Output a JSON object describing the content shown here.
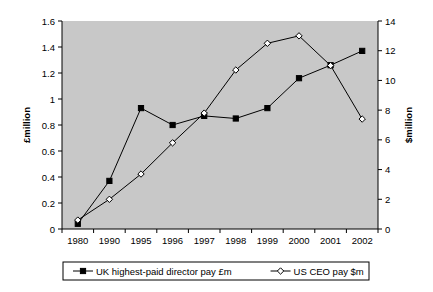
{
  "chart_data": {
    "type": "line",
    "title": "",
    "subtitle": "",
    "xlabel": "",
    "ylabel": "£million",
    "y2label": "$million",
    "categories": [
      "1980",
      "1990",
      "1995",
      "1996",
      "1997",
      "1998",
      "1999",
      "2000",
      "2001",
      "2002"
    ],
    "grid": false,
    "legend_position": "bottom",
    "ylim": [
      0,
      1.6
    ],
    "y2lim": [
      0,
      14
    ],
    "yticks": [
      "0",
      "0.2",
      "0.4",
      "0.6",
      "0.8",
      "1",
      "1.2",
      "1.4",
      "1.6"
    ],
    "ytick_values": [
      0,
      0.2,
      0.4,
      0.6,
      0.8,
      1,
      1.2,
      1.4,
      1.6
    ],
    "y2ticks": [
      "0",
      "2",
      "4",
      "6",
      "8",
      "10",
      "12",
      "14"
    ],
    "y2tick_values": [
      0,
      2,
      4,
      6,
      8,
      10,
      12,
      14
    ],
    "series": [
      {
        "name": "UK highest-paid director pay £m",
        "axis": "left",
        "marker": "filled-square",
        "values": [
          0.04,
          0.37,
          0.93,
          0.8,
          0.87,
          0.85,
          0.93,
          1.16,
          1.26,
          1.37
        ]
      },
      {
        "name": "US CEO pay $m",
        "axis": "right",
        "marker": "open-diamond",
        "values": [
          0.6,
          2.0,
          3.7,
          5.8,
          7.8,
          10.7,
          12.5,
          13.0,
          11.0,
          7.4
        ]
      }
    ]
  },
  "legend": {
    "entries": [
      {
        "label": "UK highest-paid director pay £m",
        "marker": "filled-square"
      },
      {
        "label": "US CEO pay $m",
        "marker": "open-diamond"
      }
    ]
  },
  "colors": {
    "plot_background": "#c8c8c8",
    "page_background": "#ffffff",
    "axis": "#000000",
    "series_uk": "#000000",
    "series_us": "#000000",
    "legend_background": "#ffffff"
  }
}
